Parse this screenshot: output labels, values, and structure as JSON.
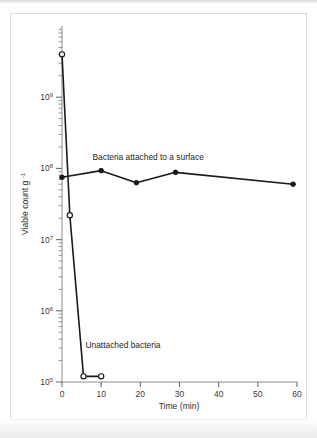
{
  "figure": {
    "caption_visible": false,
    "background_color": "#ffffff",
    "frame_color": "#dcdcdc",
    "ink_color": "#1a1a1a"
  },
  "chart_data": {
    "type": "line",
    "title": "",
    "subtitle": "",
    "xlabel": "Time (min)",
    "ylabel": "Viable count g",
    "ylabel_superscript": "-1",
    "xlim": [
      0,
      60
    ],
    "ylim": [
      100000,
      10000000000
    ],
    "yscale": "log",
    "xscale": "linear",
    "grid": false,
    "legend": "inline-annotations",
    "xticks": [
      0,
      10,
      20,
      30,
      40,
      50,
      60
    ],
    "xtick_labels": [
      "0",
      "10",
      "20",
      "30",
      "40",
      "50",
      "60"
    ],
    "yticks": [
      100000,
      1000000,
      10000000,
      100000000,
      1000000000
    ],
    "ytick_labels": [
      "10⁵",
      "10⁶",
      "10⁷",
      "10⁸",
      "10⁹"
    ],
    "ytick_mantissas": [
      "10",
      "10",
      "10",
      "10",
      "10"
    ],
    "ytick_exponents": [
      "5",
      "6",
      "7",
      "8",
      "9"
    ],
    "y_minor_ticks": true,
    "series": [
      {
        "name": "Unattached bacteria",
        "marker": "open-circle",
        "label": "Unattached bacteria",
        "label_x": 6,
        "label_y": 300000,
        "x": [
          0,
          2,
          5.5,
          10
        ],
        "y": [
          4000000000,
          22000000,
          120000,
          120000
        ]
      },
      {
        "name": "Bacteria attached to a surface",
        "marker": "filled-circle",
        "label": "Bacteria attached to a surface",
        "label_x": 22,
        "label_y": 130000000,
        "x": [
          0,
          10,
          19,
          29,
          59
        ],
        "y": [
          75000000,
          93000000,
          63000000,
          88000000,
          60000000
        ]
      }
    ],
    "annotations": [
      {
        "text": "Bacteria attached to a surface",
        "x": 22,
        "y": 130000000
      },
      {
        "text": "Unattached bacteria",
        "x": 6,
        "y": 300000
      }
    ]
  }
}
